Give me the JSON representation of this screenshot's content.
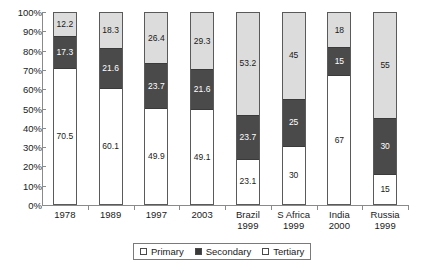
{
  "chart_data": {
    "type": "bar",
    "subtype": "stacked-percentage-column",
    "title": "",
    "xlabel": "",
    "ylabel": "",
    "ylim": [
      0,
      100
    ],
    "y_unit": "%",
    "grid": false,
    "legend_position": "bottom-center",
    "y_ticks": [
      "0%",
      "10%",
      "20%",
      "30%",
      "40%",
      "50%",
      "60%",
      "70%",
      "80%",
      "90%",
      "100%"
    ],
    "y_tick_values": [
      0,
      10,
      20,
      30,
      40,
      50,
      60,
      70,
      80,
      90,
      100
    ],
    "categories": [
      {
        "line1": "1978",
        "line2": ""
      },
      {
        "line1": "1989",
        "line2": ""
      },
      {
        "line1": "1997",
        "line2": ""
      },
      {
        "line1": "2003",
        "line2": ""
      },
      {
        "line1": "Brazil",
        "line2": "1999"
      },
      {
        "line1": "S Africa",
        "line2": "1999"
      },
      {
        "line1": "India",
        "line2": "2000"
      },
      {
        "line1": "Russia",
        "line2": "1999"
      }
    ],
    "series": [
      {
        "name": "Primary",
        "color": "#ffffff",
        "values": [
          70.5,
          60.1,
          49.9,
          49.1,
          23.1,
          30,
          67,
          15
        ]
      },
      {
        "name": "Secondary",
        "color": "#4a4a4a",
        "values": [
          17.3,
          21.6,
          23.7,
          21.6,
          23.7,
          25,
          15,
          30
        ]
      },
      {
        "name": "Tertiary",
        "color": "#dcdcdc",
        "values": [
          12.2,
          18.3,
          26.4,
          29.3,
          53.2,
          45,
          18,
          55
        ]
      }
    ],
    "data_labels": [
      {
        "category": "1978",
        "primary": "70.5",
        "secondary": "17.3",
        "tertiary": "12.2"
      },
      {
        "category": "1989",
        "primary": "60.1",
        "secondary": "21.6",
        "tertiary": "18.3"
      },
      {
        "category": "1997",
        "primary": "49.9",
        "secondary": "23.7",
        "tertiary": "26.4"
      },
      {
        "category": "2003",
        "primary": "49.1",
        "secondary": "21.6",
        "tertiary": "29.3"
      },
      {
        "category": "Brazil 1999",
        "primary": "23.1",
        "secondary": "23.7",
        "tertiary": "53.2"
      },
      {
        "category": "S Africa 1999",
        "primary": "30",
        "secondary": "25",
        "tertiary": "45"
      },
      {
        "category": "India 2000",
        "primary": "67",
        "secondary": "15",
        "tertiary": "18"
      },
      {
        "category": "Russia 1999",
        "primary": "15",
        "secondary": "30",
        "tertiary": "55"
      }
    ],
    "legend": [
      {
        "label": "Primary",
        "swatch": "open-square"
      },
      {
        "label": "Secondary",
        "swatch": "filled-square"
      },
      {
        "label": "Tertiary",
        "swatch": "open-square"
      }
    ]
  }
}
